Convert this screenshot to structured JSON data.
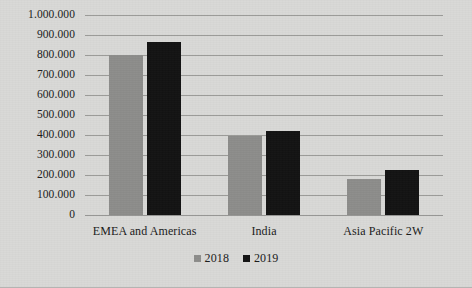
{
  "chart_data": {
    "type": "bar",
    "title": "",
    "subtitle": "",
    "xlabel": "",
    "ylabel": "",
    "categories": [
      "EMEA and Americas",
      "India",
      "Asia Pacific 2W"
    ],
    "series": [
      {
        "name": "2018",
        "color": "#8d8d8b",
        "values": [
          800000,
          395000,
          180000
        ]
      },
      {
        "name": "2019",
        "color": "#131313",
        "values": [
          865000,
          420000,
          225000
        ]
      }
    ],
    "ylim": [
      0,
      1000000
    ],
    "y_tick_labels": [
      "1.000.000",
      "900.000",
      "800.000",
      "700.000",
      "600.000",
      "500.000",
      "400.000",
      "300.000",
      "200.000",
      "100.000",
      "0"
    ],
    "y_tick_values": [
      1000000,
      900000,
      800000,
      700000,
      600000,
      500000,
      400000,
      300000,
      200000,
      100000,
      0
    ],
    "grid": true,
    "legend_position": "bottom",
    "legend_entries": [
      "2018",
      "2019"
    ],
    "plot_background": "#d9d9d7",
    "gridline_color": "#8f8f8d"
  }
}
